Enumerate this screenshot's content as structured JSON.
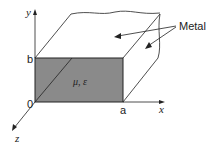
{
  "diagram": {
    "labels": {
      "y_axis": "y",
      "x_axis": "x",
      "z_axis": "z",
      "origin": "0",
      "height": "b",
      "width": "a",
      "material": "μ, ε",
      "wall": "Metal"
    },
    "colors": {
      "fill": "#8a8a8a",
      "line": "#222222",
      "background": "#ffffff"
    }
  }
}
